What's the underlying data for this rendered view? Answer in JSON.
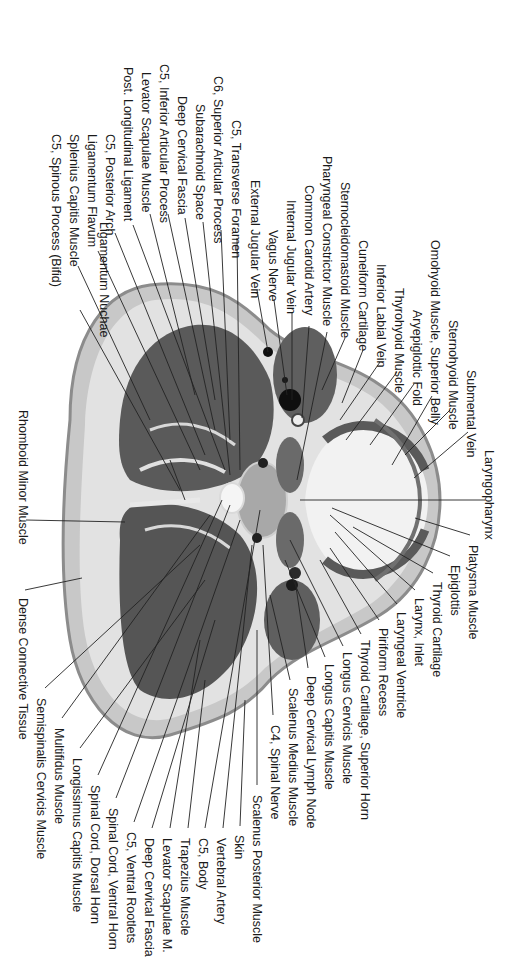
{
  "figure": {
    "colors": {
      "background": "#ffffff",
      "skin": "#9a9a9a",
      "connective": "#dcdcdc",
      "muscle": "#555555",
      "fascia": "#e8e8e8",
      "airway": "#f4f4f4",
      "vessel": "#111111",
      "leader_line": "#222222",
      "label_text": "#1a1a1a"
    }
  },
  "labels": [
    {
      "id": "ligamentum-nuchae",
      "text": "Ligamentum Nuchae",
      "x": 104,
      "y": 222,
      "tx": 170,
      "ty": 460
    },
    {
      "id": "c5-spinous-process",
      "text": "C5, Spinous Process (Bifid)",
      "x": 56,
      "y": 134,
      "tx": 80,
      "ty": 310
    },
    {
      "id": "splenius-capitis",
      "text": "Splenius Capitis Muscle",
      "x": 74,
      "y": 134,
      "tx": 78,
      "ty": 266
    },
    {
      "id": "ligamentum-flavum",
      "text": "Ligamentum Flavum",
      "x": 92,
      "y": 134,
      "tx": 98,
      "ty": 251
    },
    {
      "id": "c5-posterior-arch",
      "text": "C5, Posterior Arch",
      "x": 110,
      "y": 134,
      "tx": 115,
      "ty": 233
    },
    {
      "id": "post-longitudinal-ligament",
      "text": "Post. Longitudinal Ligament",
      "x": 128,
      "y": 67,
      "tx": 133,
      "ty": 225
    },
    {
      "id": "levator-scapulae-1",
      "text": "Levator Scapulae Muscle",
      "x": 146,
      "y": 72,
      "tx": 150,
      "ty": 214
    },
    {
      "id": "c5-inferior-articular",
      "text": "C5, Inferior Articular Process",
      "x": 164,
      "y": 64,
      "tx": 168,
      "ty": 214
    },
    {
      "id": "deep-cervical-fascia-1",
      "text": "Deep Cervical Fascia",
      "x": 182,
      "y": 96,
      "tx": 185,
      "ty": 218
    },
    {
      "id": "subarachnoid-space",
      "text": "Subarachnoid Space",
      "x": 200,
      "y": 104,
      "tx": 203,
      "ty": 222
    },
    {
      "id": "c6-superior-articular",
      "text": "C6, Superior Articular Process",
      "x": 218,
      "y": 76,
      "tx": 221,
      "ty": 230
    },
    {
      "id": "c5-transverse-foramen",
      "text": "C5, Transverse Foramen",
      "x": 236,
      "y": 120,
      "tx": 237,
      "ty": 238
    },
    {
      "id": "external-jugular-vein",
      "text": "External Jugular Vein",
      "x": 255,
      "y": 180,
      "tx": 257,
      "ty": 290
    },
    {
      "id": "vagus-nerve",
      "text": "Vagus Nerve",
      "x": 273,
      "y": 230,
      "tx": 274,
      "ty": 300
    },
    {
      "id": "internal-jugular-vein",
      "text": "Internal Jugular Vein",
      "x": 291,
      "y": 200,
      "tx": 292,
      "ty": 313
    },
    {
      "id": "common-carotid-artery",
      "text": "Common Carotid Artery",
      "x": 309,
      "y": 185,
      "tx": 309,
      "ty": 326
    },
    {
      "id": "pharyngeal-constrictor",
      "text": "Pharyngeal Constrictor Muscle",
      "x": 327,
      "y": 156,
      "tx": 327,
      "ty": 332
    },
    {
      "id": "sternocleidomastoid",
      "text": "Sternocleidomastoid Muscle",
      "x": 345,
      "y": 182,
      "tx": 345,
      "ty": 338
    },
    {
      "id": "cuneiform-cartilage",
      "text": "Cuneiform Cartilage",
      "x": 363,
      "y": 240,
      "tx": 363,
      "ty": 350
    },
    {
      "id": "inferior-labial-vein",
      "text": "Inferior Labial Vein",
      "x": 381,
      "y": 264,
      "tx": 380,
      "ty": 362
    },
    {
      "id": "thyrohyoid-muscle",
      "text": "Thyrohyoid Muscle",
      "x": 399,
      "y": 288,
      "tx": 397,
      "ty": 372
    },
    {
      "id": "aryepiglottic-fold",
      "text": "Aryepiglottic Fold",
      "x": 417,
      "y": 310,
      "tx": 414,
      "ty": 384
    },
    {
      "id": "omohyoid-superior-belly",
      "text": "Omohyoid Muscle, Superior Belly",
      "x": 435,
      "y": 240,
      "tx": 432,
      "ty": 396
    },
    {
      "id": "sternohyoid-muscle",
      "text": "Sternohyoid Muscle",
      "x": 453,
      "y": 320,
      "tx": 450,
      "ty": 410
    },
    {
      "id": "submental-vein",
      "text": "Submental Vein",
      "x": 471,
      "y": 370,
      "tx": 468,
      "ty": 432
    },
    {
      "id": "laryngopharynx",
      "text": "Laryngopharynx",
      "x": 489,
      "y": 450,
      "tx": 485,
      "ty": 500
    },
    {
      "id": "platysma-muscle",
      "text": "Platysma Muscle",
      "x": 473,
      "y": 545,
      "tx": 470,
      "ty": 535
    },
    {
      "id": "epiglottis",
      "text": "Epiglottis",
      "x": 455,
      "y": 565,
      "tx": 450,
      "ty": 556
    },
    {
      "id": "thyroid-cartilage",
      "text": "Thyroid Cartilage",
      "x": 437,
      "y": 582,
      "tx": 433,
      "ty": 573
    },
    {
      "id": "larynx-inlet",
      "text": "Larynx, Inlet",
      "x": 419,
      "y": 598,
      "tx": 415,
      "ty": 590
    },
    {
      "id": "laryngeal-ventricle",
      "text": "Laryngeal Ventricle",
      "x": 401,
      "y": 612,
      "tx": 397,
      "ty": 604
    },
    {
      "id": "piriform-recess",
      "text": "Piriform Recess",
      "x": 383,
      "y": 628,
      "tx": 379,
      "ty": 620
    },
    {
      "id": "thyroid-cartilage-superior-horn",
      "text": "Thyroid Cartilage, Superior Horn",
      "x": 365,
      "y": 640,
      "tx": 361,
      "ty": 634
    },
    {
      "id": "longus-cervicis",
      "text": "Longus Cervicis Muscle",
      "x": 347,
      "y": 652,
      "tx": 343,
      "ty": 646
    },
    {
      "id": "longus-capitis",
      "text": "Longus Capitis Muscle",
      "x": 329,
      "y": 664,
      "tx": 325,
      "ty": 657
    },
    {
      "id": "deep-cervical-lymph-node",
      "text": "Deep Cervical Lymph Node",
      "x": 311,
      "y": 676,
      "tx": 308,
      "ty": 668
    },
    {
      "id": "scalenus-medius",
      "text": "Scalenus Medius Muscle",
      "x": 293,
      "y": 688,
      "tx": 290,
      "ty": 680
    },
    {
      "id": "c4-spinal-nerve",
      "text": "C4, Spinal Nerve",
      "x": 275,
      "y": 725,
      "tx": 273,
      "ty": 715
    },
    {
      "id": "scalenus-posterior",
      "text": "Scalenus Posterior Muscle",
      "x": 257,
      "y": 795,
      "tx": 257,
      "ty": 785
    },
    {
      "id": "skin",
      "text": "Skin",
      "x": 239,
      "y": 835,
      "tx": 240,
      "ty": 826
    },
    {
      "id": "vertebral-artery",
      "text": "Vertebral Artery",
      "x": 221,
      "y": 838,
      "tx": 223,
      "ty": 828
    },
    {
      "id": "c5-body",
      "text": "C5, Body",
      "x": 203,
      "y": 838,
      "tx": 205,
      "ty": 828
    },
    {
      "id": "trapezius-muscle",
      "text": "Trapezius Muscle",
      "x": 185,
      "y": 838,
      "tx": 188,
      "ty": 828
    },
    {
      "id": "levator-scapulae-2",
      "text": "Levator Scapulae M.",
      "x": 167,
      "y": 838,
      "tx": 170,
      "ty": 828
    },
    {
      "id": "deep-cervical-fascia-2",
      "text": "Deep Cervical Fascia",
      "x": 149,
      "y": 838,
      "tx": 152,
      "ty": 828
    },
    {
      "id": "c5-ventral-rootlets",
      "text": "C5, Ventral Rootlets",
      "x": 131,
      "y": 832,
      "tx": 134,
      "ty": 822
    },
    {
      "id": "spinal-cord-ventral-horn",
      "text": "Spinal Cord, Ventral Horn",
      "x": 113,
      "y": 808,
      "tx": 116,
      "ty": 798
    },
    {
      "id": "spinal-cord-dorsal-horn",
      "text": "Spinal Cord, Dorsal Horn",
      "x": 95,
      "y": 785,
      "tx": 98,
      "ty": 775
    },
    {
      "id": "longissimus-capitis",
      "text": "Longissimus Capitis Muscle",
      "x": 77,
      "y": 758,
      "tx": 80,
      "ty": 748
    },
    {
      "id": "multifidus",
      "text": "Multifidus Muscle",
      "x": 59,
      "y": 728,
      "tx": 62,
      "ty": 718
    },
    {
      "id": "semispinalis-cervicis",
      "text": "Semispinalis Cervicis Muscle",
      "x": 41,
      "y": 698,
      "tx": 45,
      "ty": 688
    },
    {
      "id": "dense-connective-tissue",
      "text": "Dense Connective Tissue",
      "x": 23,
      "y": 598,
      "tx": 25,
      "ty": 590
    },
    {
      "id": "rhomboid-minor",
      "text": "Rhomboid Minor  Muscle",
      "x": 23,
      "y": 410,
      "tx": 26,
      "ty": 520
    }
  ],
  "targets": [
    {
      "id": "ligamentum-nuchae",
      "x": 185,
      "y": 500
    },
    {
      "id": "c5-spinous-process",
      "x": 180,
      "y": 490
    },
    {
      "id": "splenius-capitis",
      "x": 150,
      "y": 420
    },
    {
      "id": "ligamentum-flavum",
      "x": 200,
      "y": 470
    },
    {
      "id": "c5-posterior-arch",
      "x": 205,
      "y": 455
    },
    {
      "id": "post-longitudinal-ligament",
      "x": 225,
      "y": 470
    },
    {
      "id": "levator-scapulae-1",
      "x": 195,
      "y": 395
    },
    {
      "id": "c5-inferior-articular",
      "x": 215,
      "y": 430
    },
    {
      "id": "deep-cervical-fascia-1",
      "x": 215,
      "y": 400
    },
    {
      "id": "subarachnoid-space",
      "x": 230,
      "y": 475
    },
    {
      "id": "c6-superior-articular",
      "x": 230,
      "y": 440
    },
    {
      "id": "c5-transverse-foramen",
      "x": 240,
      "y": 470
    },
    {
      "id": "external-jugular-vein",
      "x": 268,
      "y": 352
    },
    {
      "id": "vagus-nerve",
      "x": 287,
      "y": 395
    },
    {
      "id": "internal-jugular-vein",
      "x": 292,
      "y": 400
    },
    {
      "id": "common-carotid-artery",
      "x": 302,
      "y": 418
    },
    {
      "id": "pharyngeal-constrictor",
      "x": 297,
      "y": 480
    },
    {
      "id": "sternocleidomastoid",
      "x": 322,
      "y": 390
    },
    {
      "id": "cuneiform-cartilage",
      "x": 342,
      "y": 403
    },
    {
      "id": "inferior-labial-vein",
      "x": 340,
      "y": 420
    },
    {
      "id": "thyrohyoid-muscle",
      "x": 346,
      "y": 440
    },
    {
      "id": "aryepiglottic-fold",
      "x": 370,
      "y": 445
    },
    {
      "id": "omohyoid-superior-belly",
      "x": 392,
      "y": 465
    },
    {
      "id": "sternohyoid-muscle",
      "x": 405,
      "y": 455
    },
    {
      "id": "submental-vein",
      "x": 414,
      "y": 478
    },
    {
      "id": "laryngopharynx",
      "x": 300,
      "y": 500
    },
    {
      "id": "platysma-muscle",
      "x": 415,
      "y": 518
    },
    {
      "id": "epiglottis",
      "x": 332,
      "y": 508
    },
    {
      "id": "thyroid-cartilage",
      "x": 353,
      "y": 527
    },
    {
      "id": "larynx-inlet",
      "x": 330,
      "y": 515
    },
    {
      "id": "laryngeal-ventricle",
      "x": 335,
      "y": 532
    },
    {
      "id": "piriform-recess",
      "x": 330,
      "y": 548
    },
    {
      "id": "thyroid-cartilage-superior-horn",
      "x": 320,
      "y": 560
    },
    {
      "id": "longus-cervicis",
      "x": 290,
      "y": 540
    },
    {
      "id": "longus-capitis",
      "x": 285,
      "y": 560
    },
    {
      "id": "deep-cervical-lymph-node",
      "x": 295,
      "y": 580
    },
    {
      "id": "scalenus-medius",
      "x": 270,
      "y": 595
    },
    {
      "id": "c4-spinal-nerve",
      "x": 263,
      "y": 545
    },
    {
      "id": "scalenus-posterior",
      "x": 257,
      "y": 630
    },
    {
      "id": "skin",
      "x": 245,
      "y": 700
    },
    {
      "id": "vertebral-artery",
      "x": 252,
      "y": 545
    },
    {
      "id": "c5-body",
      "x": 260,
      "y": 510
    },
    {
      "id": "trapezius-muscle",
      "x": 205,
      "y": 680
    },
    {
      "id": "levator-scapulae-2",
      "x": 200,
      "y": 640
    },
    {
      "id": "deep-cervical-fascia-2",
      "x": 215,
      "y": 620
    },
    {
      "id": "c5-ventral-rootlets",
      "x": 240,
      "y": 520
    },
    {
      "id": "spinal-cord-ventral-horn",
      "x": 230,
      "y": 505
    },
    {
      "id": "spinal-cord-dorsal-horn",
      "x": 222,
      "y": 500
    },
    {
      "id": "longissimus-capitis",
      "x": 205,
      "y": 580
    },
    {
      "id": "multifidus",
      "x": 210,
      "y": 515
    },
    {
      "id": "semispinalis-cervicis",
      "x": 200,
      "y": 545
    },
    {
      "id": "dense-connective-tissue",
      "x": 82,
      "y": 578
    },
    {
      "id": "rhomboid-minor",
      "x": 125,
      "y": 522
    }
  ]
}
